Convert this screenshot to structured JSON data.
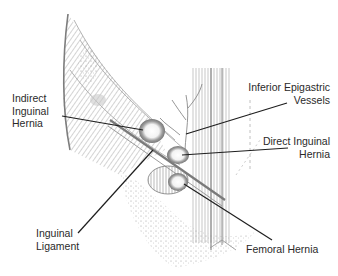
{
  "diagram": {
    "labels": [
      {
        "id": "indirect",
        "text": "Indirect\nInguinal\nHernia",
        "x": 12,
        "y": 92,
        "align": "left",
        "line": [
          62,
          116,
          143,
          130
        ]
      },
      {
        "id": "epigastric",
        "text": "Inferior Epigastric\nVessels",
        "right": 8,
        "y": 81,
        "align": "right",
        "line": [
          287,
          103,
          186,
          134
        ]
      },
      {
        "id": "direct",
        "text": "Direct Inguinal\nHernia",
        "right": 8,
        "y": 135,
        "align": "right",
        "line": [
          288,
          148,
          182,
          155
        ]
      },
      {
        "id": "ligament",
        "text": "Inguinal\nLigament",
        "x": 36,
        "y": 227,
        "align": "left",
        "line": [
          78,
          233,
          153,
          150
        ]
      },
      {
        "id": "femoral",
        "text": "Femoral Hernia",
        "x": 246,
        "y": 243,
        "align": "left",
        "line": [
          272,
          240,
          184,
          184
        ]
      }
    ],
    "colors": {
      "ink": "#2a2a2a",
      "sketch": "#8a8a8a",
      "stipple": "#b5b5b5",
      "leader": "#1e1e1e"
    }
  }
}
